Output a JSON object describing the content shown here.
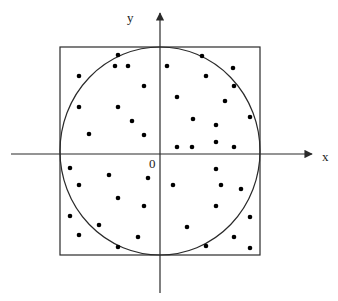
{
  "diagram": {
    "labels": {
      "x_axis": "x",
      "y_axis": "y",
      "origin": "0"
    },
    "colors": {
      "stroke": "#2a2a2a",
      "dot": "#000000",
      "background": "#ffffff"
    },
    "square": {
      "x": 60,
      "y": 47,
      "width": 200,
      "height": 208
    },
    "circle": {
      "cx": 160,
      "cy": 151,
      "rx": 100,
      "ry": 104
    },
    "x_axis": {
      "x1": 11,
      "x2": 312,
      "y": 154
    },
    "y_axis": {
      "x": 160,
      "y1": 293,
      "y2": 13
    },
    "points": [
      [
        118,
        55
      ],
      [
        115,
        66
      ],
      [
        128,
        66
      ],
      [
        79,
        76
      ],
      [
        144,
        86
      ],
      [
        79,
        107
      ],
      [
        118,
        107
      ],
      [
        132,
        121
      ],
      [
        89,
        134
      ],
      [
        144,
        135
      ],
      [
        167,
        66
      ],
      [
        202,
        56
      ],
      [
        233,
        68
      ],
      [
        206,
        76
      ],
      [
        234,
        86
      ],
      [
        177,
        97
      ],
      [
        225,
        101
      ],
      [
        250,
        117
      ],
      [
        193,
        119
      ],
      [
        216,
        125
      ],
      [
        216,
        142
      ],
      [
        177,
        147
      ],
      [
        192,
        147
      ],
      [
        234,
        147
      ],
      [
        70,
        168
      ],
      [
        109,
        175
      ],
      [
        148,
        178
      ],
      [
        79,
        185
      ],
      [
        118,
        198
      ],
      [
        144,
        206
      ],
      [
        70,
        216
      ],
      [
        99,
        225
      ],
      [
        79,
        235
      ],
      [
        138,
        237
      ],
      [
        118,
        247
      ],
      [
        216,
        169
      ],
      [
        173,
        185
      ],
      [
        221,
        185
      ],
      [
        241,
        189
      ],
      [
        216,
        206
      ],
      [
        250,
        217
      ],
      [
        187,
        227
      ],
      [
        234,
        237
      ],
      [
        206,
        246
      ],
      [
        250,
        248
      ]
    ]
  }
}
